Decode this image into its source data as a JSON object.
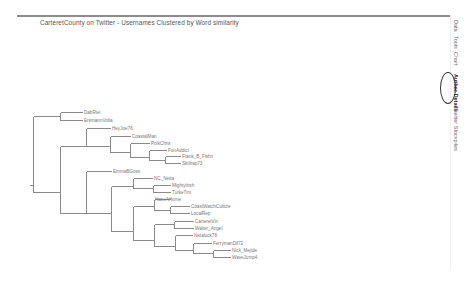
{
  "title": "CarteretCounty on Twitter - Usernames Clustered by Word similarity",
  "side_tabs": [
    {
      "label": "Data",
      "top": 20,
      "active": false
    },
    {
      "label": "Tools",
      "top": 36,
      "active": false
    },
    {
      "label": "Chart",
      "top": 52,
      "active": false
    },
    {
      "label": "Author Details",
      "top": 74,
      "active": true
    },
    {
      "label": "Twitter Stockpiles",
      "top": 108,
      "active": false
    }
  ],
  "colors": {
    "line": "#8a8a8a",
    "label": "#777777",
    "title": "#555555",
    "circle": "#333333"
  },
  "dendrogram": {
    "leaves": [
      {
        "label": "DabRiel",
        "x": 83,
        "y": 112
      },
      {
        "label": "ErsmannVolta",
        "x": 83,
        "y": 120
      },
      {
        "label": "HeyJoe76",
        "x": 111,
        "y": 128
      },
      {
        "label": "CoastalMan",
        "x": 131,
        "y": 136
      },
      {
        "label": "PolkChris",
        "x": 150,
        "y": 143
      },
      {
        "label": "FunAddict",
        "x": 167,
        "y": 150
      },
      {
        "label": "Frank_B_Fishn",
        "x": 181,
        "y": 156
      },
      {
        "label": "Skiltrap73",
        "x": 181,
        "y": 163
      },
      {
        "label": "EmmaBGoss",
        "x": 112,
        "y": 171
      },
      {
        "label": "NC_Netta",
        "x": 153,
        "y": 178
      },
      {
        "label": "MightyIrish",
        "x": 171,
        "y": 185
      },
      {
        "label": "TurkeTim",
        "x": 171,
        "y": 192
      },
      {
        "label": "HaseAHome",
        "x": 154,
        "y": 199
      },
      {
        "label": "CoastWatchCulture",
        "x": 190,
        "y": 206
      },
      {
        "label": "LocalRep",
        "x": 190,
        "y": 213
      },
      {
        "label": "CarteretVin",
        "x": 194,
        "y": 221
      },
      {
        "label": "Walter_Angel",
        "x": 194,
        "y": 228
      },
      {
        "label": "Netaluck78",
        "x": 193,
        "y": 235
      },
      {
        "label": "FerrymanDif72",
        "x": 212,
        "y": 243
      },
      {
        "label": "Nick_Mejide",
        "x": 231,
        "y": 250
      },
      {
        "label": "WaveJump4",
        "x": 231,
        "y": 257
      }
    ],
    "lines": [
      [
        29,
        185,
        33,
        185
      ],
      [
        33,
        116,
        33,
        192
      ],
      [
        33,
        116,
        60,
        116
      ],
      [
        33,
        192,
        60,
        192
      ],
      [
        60,
        112,
        60,
        120
      ],
      [
        60,
        112,
        82,
        112
      ],
      [
        60,
        120,
        82,
        120
      ],
      [
        60,
        146,
        60,
        213
      ],
      [
        60,
        146,
        86,
        146
      ],
      [
        60,
        213,
        86,
        213
      ],
      [
        86,
        128,
        86,
        146
      ],
      [
        86,
        128,
        110,
        128
      ],
      [
        86,
        146,
        110,
        146
      ],
      [
        110,
        136,
        110,
        152
      ],
      [
        110,
        136,
        130,
        136
      ],
      [
        110,
        152,
        130,
        152
      ],
      [
        130,
        143,
        130,
        157
      ],
      [
        130,
        143,
        149,
        143
      ],
      [
        130,
        157,
        149,
        157
      ],
      [
        149,
        150,
        149,
        160
      ],
      [
        149,
        150,
        166,
        150
      ],
      [
        149,
        160,
        165,
        160
      ],
      [
        165,
        156,
        165,
        163
      ],
      [
        165,
        156,
        180,
        156
      ],
      [
        165,
        163,
        180,
        163
      ],
      [
        86,
        171,
        86,
        213
      ],
      [
        86,
        171,
        111,
        171
      ],
      [
        111,
        186,
        111,
        231
      ],
      [
        86,
        213,
        111,
        213
      ],
      [
        111,
        186,
        133,
        186
      ],
      [
        111,
        231,
        133,
        231
      ],
      [
        133,
        178,
        133,
        188
      ],
      [
        133,
        178,
        152,
        178
      ],
      [
        133,
        188,
        153,
        188
      ],
      [
        153,
        185,
        153,
        192
      ],
      [
        153,
        185,
        170,
        185
      ],
      [
        153,
        192,
        170,
        192
      ],
      [
        133,
        206,
        133,
        240
      ],
      [
        133,
        206,
        154,
        206
      ],
      [
        133,
        240,
        154,
        240
      ],
      [
        154,
        199,
        154,
        210
      ],
      [
        154,
        199,
        170,
        199
      ],
      [
        154,
        210,
        170,
        210
      ],
      [
        170,
        206,
        170,
        213
      ],
      [
        170,
        206,
        189,
        206
      ],
      [
        170,
        213,
        189,
        213
      ],
      [
        154,
        224,
        154,
        246
      ],
      [
        154,
        224,
        174,
        224
      ],
      [
        154,
        246,
        175,
        246
      ],
      [
        174,
        221,
        174,
        228
      ],
      [
        174,
        221,
        193,
        221
      ],
      [
        174,
        228,
        193,
        228
      ],
      [
        175,
        235,
        175,
        250
      ],
      [
        175,
        235,
        192,
        235
      ],
      [
        175,
        250,
        193,
        250
      ],
      [
        193,
        243,
        193,
        253
      ],
      [
        193,
        243,
        211,
        243
      ],
      [
        193,
        253,
        213,
        253
      ],
      [
        213,
        250,
        213,
        257
      ],
      [
        213,
        250,
        230,
        250
      ],
      [
        213,
        257,
        230,
        257
      ]
    ]
  }
}
